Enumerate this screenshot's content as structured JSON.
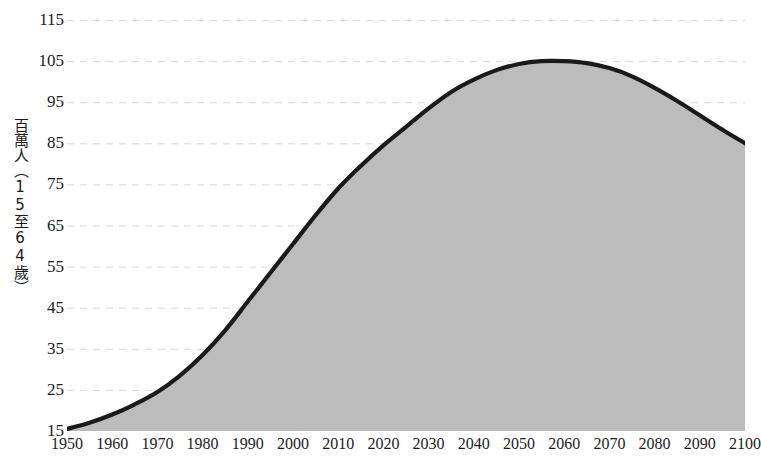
{
  "chart_data": {
    "type": "area",
    "title": "",
    "subtitle": "",
    "xlabel": "",
    "ylabel": "百萬人（15至64歲）",
    "xlim": [
      1950,
      2100
    ],
    "ylim": [
      15,
      115
    ],
    "grid": true,
    "legend": "none",
    "y_ticks": [
      115,
      105,
      95,
      85,
      75,
      65,
      55,
      45,
      35,
      25,
      15
    ],
    "x_ticks": [
      1950,
      1960,
      1970,
      1980,
      1990,
      2000,
      2010,
      2020,
      2030,
      2040,
      2050,
      2060,
      2070,
      2080,
      2090,
      2100
    ],
    "series": [
      {
        "name": "working-age-population",
        "x": [
          1950,
          1955,
          1960,
          1965,
          1970,
          1975,
          1980,
          1985,
          1990,
          1995,
          2000,
          2005,
          2010,
          2015,
          2020,
          2025,
          2030,
          2035,
          2040,
          2045,
          2050,
          2055,
          2060,
          2065,
          2070,
          2075,
          2080,
          2085,
          2090,
          2095,
          2100
        ],
        "values": [
          15.5,
          17.0,
          19.0,
          21.5,
          24.5,
          28.5,
          33.5,
          39.5,
          46.5,
          53.5,
          60.5,
          67.5,
          74.0,
          79.5,
          84.5,
          89.0,
          93.5,
          97.5,
          100.5,
          102.8,
          104.3,
          105.0,
          105.0,
          104.5,
          103.3,
          101.3,
          98.5,
          95.3,
          91.8,
          88.3,
          85.0
        ],
        "fill_color": "#bcbcbc",
        "line_color": "#1a1a1a"
      }
    ],
    "annotations": []
  },
  "style": {
    "background": "#ffffff",
    "gridline_color": "#d8d8d8",
    "tick_label_color": "#1c1c1c"
  }
}
